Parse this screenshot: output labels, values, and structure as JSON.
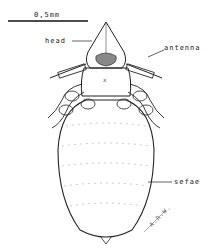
{
  "diagram": {
    "scale_bar": {
      "label": "0,5mm"
    },
    "labels": {
      "head": "head",
      "antenna": "antenna",
      "setae": "sefae"
    },
    "signature": "A.R.W."
  }
}
